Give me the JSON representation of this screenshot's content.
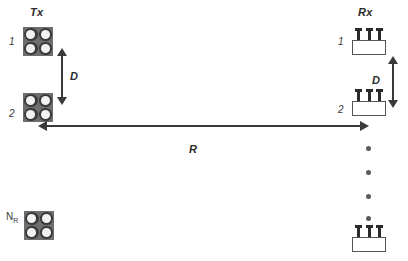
{
  "diagram": {
    "title_tx": "Tx",
    "title_rx": "Rx",
    "dim_d_left": "D",
    "dim_d_right": "D",
    "dim_r": "R",
    "tx_elements": [
      {
        "label": "1",
        "type": "patch-array-2x2"
      },
      {
        "label": "2",
        "type": "patch-array-2x2"
      },
      {
        "label_base": "N",
        "label_sub": "R",
        "type": "patch-array-2x2"
      }
    ],
    "rx_elements": [
      {
        "label": "1",
        "type": "monopole-array-3"
      },
      {
        "label": "2",
        "type": "monopole-array-3"
      },
      {
        "label": "",
        "type": "monopole-array-3"
      }
    ],
    "ellipsis_count": 4,
    "colors": {
      "tx_substrate": "#6e6e6e",
      "tx_patch_ring": "#3a3a3a",
      "tx_patch_fill": "#f2f2f2",
      "rx_box_fill": "#ffffff",
      "rx_box_border": "#555555",
      "rx_pin": "#2a2a2a",
      "arrow": "#3a3a3a",
      "dot": "#5a5a5a",
      "text": "#2b2b2b",
      "background": "#ffffff"
    }
  }
}
